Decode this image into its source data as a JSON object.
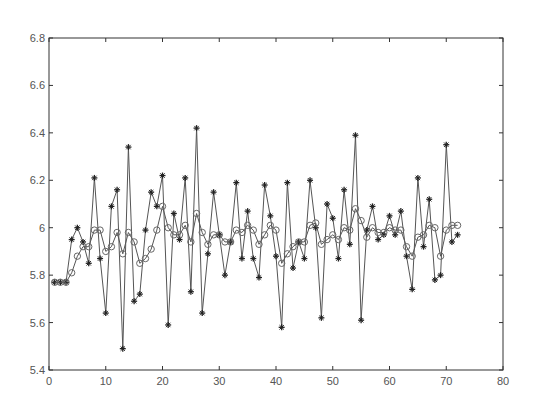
{
  "chart_data": {
    "type": "line",
    "title": "",
    "xlabel": "",
    "ylabel": "",
    "xlim": [
      0,
      80
    ],
    "ylim": [
      5.4,
      6.8
    ],
    "grid": false,
    "legend": null,
    "x_ticks": [
      0,
      10,
      20,
      30,
      40,
      50,
      60,
      70,
      80
    ],
    "x_tick_labels": [
      "0",
      "10",
      "20",
      "30",
      "40",
      "50",
      "60",
      "70",
      "80"
    ],
    "y_ticks": [
      5.4,
      5.6,
      5.8,
      6.0,
      6.2,
      6.4,
      6.6,
      6.8
    ],
    "y_tick_labels": [
      "5.4",
      "5.6",
      "5.8",
      "6",
      "6.2",
      "6.4",
      "6.6",
      "6.8"
    ],
    "x": [
      1,
      2,
      3,
      4,
      5,
      6,
      7,
      8,
      9,
      10,
      11,
      12,
      13,
      14,
      15,
      16,
      17,
      18,
      19,
      20,
      21,
      22,
      23,
      24,
      25,
      26,
      27,
      28,
      29,
      30,
      31,
      32,
      33,
      34,
      35,
      36,
      37,
      38,
      39,
      40,
      41,
      42,
      43,
      44,
      45,
      46,
      47,
      48,
      49,
      50,
      51,
      52,
      53,
      54,
      55,
      56,
      57,
      58,
      59,
      60,
      61,
      62,
      63,
      64,
      65,
      66,
      67,
      68,
      69,
      70,
      71,
      72
    ],
    "series": [
      {
        "name": "raw",
        "marker": "star",
        "values": [
          5.77,
          5.77,
          5.77,
          5.95,
          6.0,
          5.94,
          5.85,
          6.21,
          5.87,
          5.64,
          6.09,
          6.16,
          5.49,
          6.34,
          5.69,
          5.72,
          5.99,
          6.15,
          6.09,
          6.22,
          5.59,
          6.06,
          5.95,
          6.21,
          5.73,
          6.42,
          5.64,
          5.89,
          6.15,
          5.97,
          5.8,
          5.94,
          6.19,
          5.87,
          6.07,
          5.87,
          5.79,
          6.18,
          6.05,
          5.88,
          5.58,
          6.19,
          5.83,
          5.94,
          5.87,
          6.2,
          6.0,
          5.62,
          6.1,
          6.04,
          5.87,
          6.16,
          5.93,
          6.39,
          5.61,
          5.99,
          6.09,
          5.95,
          5.97,
          6.05,
          5.97,
          6.07,
          5.88,
          5.74,
          6.21,
          5.92,
          6.12,
          5.78,
          5.8,
          6.35,
          5.94,
          5.97
        ]
      },
      {
        "name": "smoothed",
        "marker": "circle",
        "values": [
          5.77,
          5.77,
          5.77,
          5.81,
          5.88,
          5.92,
          5.92,
          5.99,
          5.99,
          5.9,
          5.92,
          5.98,
          5.89,
          5.98,
          5.94,
          5.85,
          5.87,
          5.91,
          5.99,
          6.09,
          6.0,
          5.97,
          5.97,
          6.01,
          5.94,
          6.06,
          5.98,
          5.93,
          5.97,
          5.97,
          5.94,
          5.94,
          5.99,
          5.98,
          6.01,
          5.99,
          5.93,
          5.97,
          6.01,
          5.99,
          5.85,
          5.89,
          5.92,
          5.94,
          5.94,
          6.01,
          6.02,
          5.93,
          5.95,
          5.97,
          5.95,
          6.0,
          5.99,
          6.08,
          6.03,
          5.96,
          6.0,
          5.98,
          5.98,
          6.0,
          5.99,
          5.99,
          5.92,
          5.88,
          5.96,
          5.97,
          6.01,
          6.0,
          5.88,
          5.99,
          6.01,
          6.01
        ]
      }
    ]
  }
}
